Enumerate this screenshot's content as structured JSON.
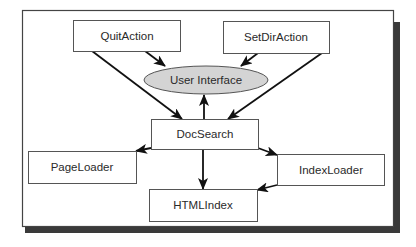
{
  "diagram": {
    "type": "class-dependency-diagram",
    "colors": {
      "background": "#ffffff",
      "frame_border": "#444444",
      "frame_shadow": "#3a3a3a",
      "box_border": "#555555",
      "box_fill": "#ffffff",
      "ellipse_fill": "#d4d4d4",
      "ellipse_border": "#555555",
      "arrow": "#111111",
      "text": "#2a2a2a"
    },
    "nodes": [
      {
        "id": "quit",
        "label": "QuitAction",
        "shape": "rect"
      },
      {
        "id": "setdir",
        "label": "SetDirAction",
        "shape": "rect"
      },
      {
        "id": "ui",
        "label": "User Interface",
        "shape": "ellipse"
      },
      {
        "id": "docsearch",
        "label": "DocSearch",
        "shape": "rect"
      },
      {
        "id": "pageloader",
        "label": "PageLoader",
        "shape": "rect"
      },
      {
        "id": "indexloader",
        "label": "IndexLoader",
        "shape": "rect"
      },
      {
        "id": "htmlindex",
        "label": "HTMLIndex",
        "shape": "rect"
      }
    ],
    "edges": [
      {
        "from": "QuitAction",
        "to": "User Interface"
      },
      {
        "from": "QuitAction",
        "to": "DocSearch"
      },
      {
        "from": "SetDirAction",
        "to": "User Interface"
      },
      {
        "from": "SetDirAction",
        "to": "DocSearch"
      },
      {
        "from": "DocSearch",
        "to": "User Interface"
      },
      {
        "from": "DocSearch",
        "to": "PageLoader"
      },
      {
        "from": "DocSearch",
        "to": "IndexLoader"
      },
      {
        "from": "DocSearch",
        "to": "HTMLIndex"
      },
      {
        "from": "IndexLoader",
        "to": "HTMLIndex"
      }
    ]
  }
}
